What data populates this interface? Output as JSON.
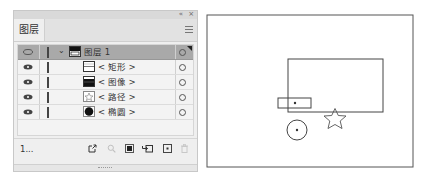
{
  "panel": {
    "collapse_icon": "«",
    "close_icon": "×",
    "tab_label": "图层",
    "menu_icon": "panel-menu-icon",
    "layers": [
      {
        "name": "图层 1",
        "type": "layer",
        "visible": true,
        "expanded": true,
        "selected": true,
        "thumbnail": "layer-thumbnail"
      },
      {
        "name": "< 矩形 >",
        "type": "sublayer",
        "visible": true,
        "thumbnail": "rectangle-thumbnail"
      },
      {
        "name": "< 图像 >",
        "type": "sublayer",
        "visible": true,
        "thumbnail": "image-thumbnail"
      },
      {
        "name": "< 路径 >",
        "type": "sublayer",
        "visible": true,
        "thumbnail": "path-thumbnail"
      },
      {
        "name": "< 椭圆 >",
        "type": "sublayer",
        "visible": true,
        "thumbnail": "ellipse-thumbnail"
      }
    ],
    "footer": {
      "layer_count": "1...",
      "buttons": [
        "export-icon",
        "locate-object-icon",
        "clipping-mask-icon",
        "new-sublayer-icon",
        "new-layer-icon",
        "delete-icon"
      ]
    }
  },
  "colors": {
    "selected_row": "#a9a9a9",
    "layer_color": "#444444"
  }
}
